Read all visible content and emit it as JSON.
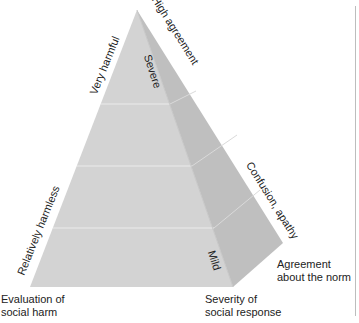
{
  "diagram": {
    "type": "pyramid",
    "colors": {
      "front_face": "#d4d4d4",
      "side_face": "#c0c0c0",
      "divider": "#ececec",
      "text": "#222222",
      "frame_line": "#bdbdbd"
    },
    "levels": 4,
    "edge_labels": {
      "top_left_edge": "Very harmful",
      "bottom_left_edge": "Relatively harmless",
      "top_right_edge": "High agreement",
      "bottom_right_edge": "Confusion, apathy"
    },
    "face_labels": {
      "top": "Severe",
      "bottom": "Mild"
    },
    "axis_labels": {
      "left": {
        "line1": "Evaluation of",
        "line2": "social harm"
      },
      "middle": {
        "line1": "Severity of",
        "line2": "social response"
      },
      "right": {
        "line1": "Agreement",
        "line2": "about the norm"
      }
    }
  }
}
